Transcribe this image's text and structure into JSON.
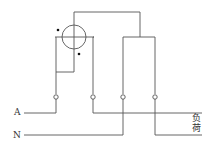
{
  "diagram": {
    "labels": {
      "line": "A",
      "neutral": "N",
      "load_char1": "负",
      "load_char2": "荷"
    },
    "colors": {
      "wire": "#555555",
      "background": "#ffffff"
    },
    "terminals": [
      {
        "id": 1,
        "x": 56,
        "y": 97
      },
      {
        "id": 2,
        "x": 93,
        "y": 97
      },
      {
        "id": 3,
        "x": 123,
        "y": 97
      },
      {
        "id": 4,
        "x": 155,
        "y": 97
      }
    ]
  }
}
